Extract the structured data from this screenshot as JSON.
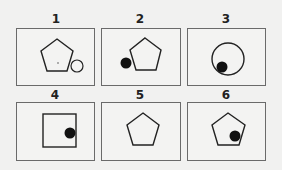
{
  "figure": {
    "panels": [
      {
        "label": "1",
        "description": "pentagon with small open circle at lower-right vertex, tiny dot inside pentagon"
      },
      {
        "label": "2",
        "description": "pentagon with black dot at left vertex"
      },
      {
        "label": "3",
        "description": "circle with black dot inside at lower-left"
      },
      {
        "label": "4",
        "description": "square with black dot at right edge"
      },
      {
        "label": "5",
        "description": "plain pentagon"
      },
      {
        "label": "6",
        "description": "pentagon with black dot inside near lower-right"
      }
    ],
    "colors": {
      "stroke": "#222222",
      "fill_dot": "#111111",
      "border": "#6a6a6a",
      "background": "#f1f1f0"
    }
  }
}
